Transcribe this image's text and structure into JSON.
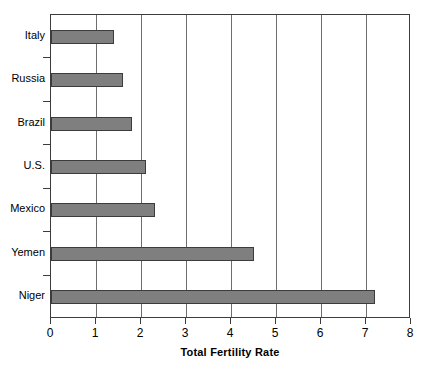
{
  "chart_data": {
    "type": "bar",
    "orientation": "horizontal",
    "title": "",
    "xlabel": "Total Fertility Rate",
    "ylabel": "",
    "categories": [
      "Italy",
      "Russia",
      "Brazil",
      "U.S.",
      "Mexico",
      "Yemen",
      "Niger"
    ],
    "values": [
      1.4,
      1.6,
      1.8,
      2.1,
      2.3,
      4.5,
      7.2
    ],
    "xlim": [
      0,
      8
    ],
    "xticks": [
      0,
      1,
      2,
      3,
      4,
      5,
      6,
      7,
      8
    ],
    "xtick_labels": [
      "0",
      "1",
      "2",
      "3",
      "4",
      "5",
      "6",
      "7",
      "8"
    ],
    "grid": "vertical",
    "legend": "none",
    "bar_color": "#7f7f7f",
    "bar_edge_color": "#3c3c3c",
    "gridline_color": "#6e6e6e",
    "axis_color": "#3c3c3c",
    "background_color": "#ffffff"
  }
}
